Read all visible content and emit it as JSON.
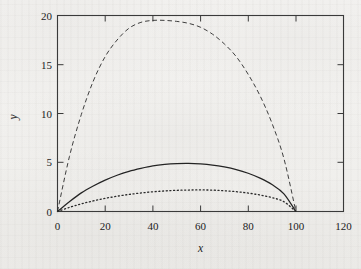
{
  "figure": {
    "kind": "scanned-page-figure",
    "background_color": "#f2f1ef",
    "ink_color": "#1c1c1c",
    "frame": {
      "border": true,
      "grid": false
    }
  },
  "chart_data": {
    "type": "line",
    "title": "",
    "subtitle": "",
    "xlabel": "x",
    "ylabel": "y",
    "xlim": [
      0,
      120
    ],
    "ylim": [
      0,
      20
    ],
    "xticks": [
      0,
      20,
      40,
      60,
      80,
      100,
      120
    ],
    "yticks": [
      0,
      5,
      10,
      15,
      20
    ],
    "xtick_labels": [
      "0",
      "20",
      "40",
      "60",
      "80",
      "100",
      "120"
    ],
    "ytick_labels": [
      "0",
      "5",
      "10",
      "15",
      "20"
    ],
    "grid": false,
    "legend": false,
    "legend_position": "none",
    "annotations": [],
    "x": [
      0,
      5,
      10,
      15,
      20,
      25,
      30,
      35,
      40,
      45,
      50,
      55,
      60,
      65,
      70,
      75,
      80,
      85,
      90,
      95,
      100
    ],
    "series": [
      {
        "name": "upper-curve",
        "style": "dashed",
        "peak_x": 50,
        "peak_y": 19.5,
        "values": [
          0.0,
          5.6,
          9.9,
          13.3,
          15.8,
          17.5,
          18.7,
          19.3,
          19.5,
          19.5,
          19.4,
          19.2,
          18.8,
          18.1,
          17.1,
          15.8,
          14.0,
          11.8,
          9.0,
          5.4,
          0.0
        ]
      },
      {
        "name": "middle-curve",
        "style": "solid",
        "peak_x": 52,
        "peak_y": 4.9,
        "values": [
          0.0,
          1.0,
          1.9,
          2.6,
          3.2,
          3.7,
          4.1,
          4.4,
          4.65,
          4.8,
          4.88,
          4.9,
          4.85,
          4.74,
          4.55,
          4.28,
          3.9,
          3.4,
          2.75,
          1.8,
          0.0
        ]
      },
      {
        "name": "lower-curve",
        "style": "dotted",
        "peak_x": 54,
        "peak_y": 2.2,
        "values": [
          0.0,
          0.42,
          0.78,
          1.08,
          1.34,
          1.56,
          1.74,
          1.89,
          2.01,
          2.1,
          2.16,
          2.19,
          2.2,
          2.18,
          2.12,
          2.02,
          1.88,
          1.68,
          1.42,
          1.0,
          0.0
        ]
      }
    ]
  }
}
